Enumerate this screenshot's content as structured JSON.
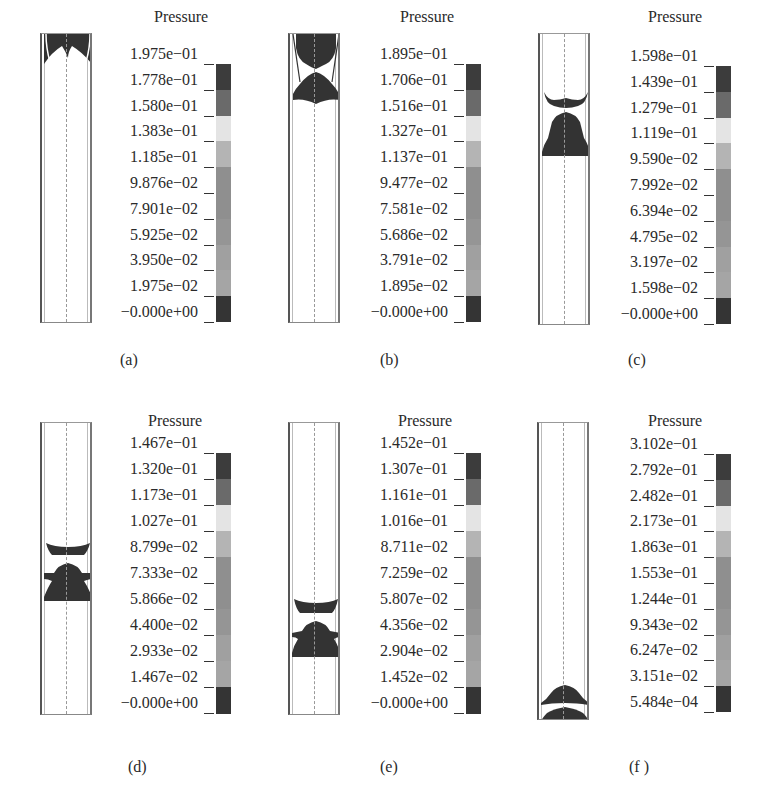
{
  "figure": {
    "colorbar_colors": [
      "#3c3c3c",
      "#6a6a6a",
      "#e4e4e4",
      "#b4b4b4",
      "#8f8f8f",
      "#8f8f8f",
      "#959595",
      "#a0a0a0",
      "#a5a5a5",
      "#343434",
      "#2c2c2c"
    ],
    "field_color": "#333333",
    "panels": [
      {
        "caption": "(a)",
        "title": "Pressure",
        "labels": [
          "1.975e−01",
          "1.778e−01",
          "1.580e−01",
          "1.383e−01",
          "1.185e−01",
          "9.876e−02",
          "7.901e−02",
          "5.925e−02",
          "3.950e−02",
          "1.975e−02",
          "−0.000e+00"
        ]
      },
      {
        "caption": "(b)",
        "title": "Pressure",
        "labels": [
          "1.895e−01",
          "1.706e−01",
          "1.516e−01",
          "1.327e−01",
          "1.137e−01",
          "9.477e−02",
          "7.581e−02",
          "5.686e−02",
          "3.791e−02",
          "1.895e−02",
          "−0.000e+00"
        ]
      },
      {
        "caption": "(c)",
        "title": "Pressure",
        "labels": [
          "1.598e−01",
          "1.439e−01",
          "1.279e−01",
          "1.119e−01",
          "9.590e−02",
          "7.992e−02",
          "6.394e−02",
          "4.795e−02",
          "3.197e−02",
          "1.598e−02",
          "−0.000e+00"
        ]
      },
      {
        "caption": "(d)",
        "title": "Pressure",
        "labels": [
          "1.467e−01",
          "1.320e−01",
          "1.173e−01",
          "1.027e−01",
          "8.799e−02",
          "7.333e−02",
          "5.866e−02",
          "4.400e−02",
          "2.933e−02",
          "1.467e−02",
          "−0.000e+00"
        ]
      },
      {
        "caption": "(e)",
        "title": "Pressure",
        "labels": [
          "1.452e−01",
          "1.307e−01",
          "1.161e−01",
          "1.016e−01",
          "8.711e−02",
          "7.259e−02",
          "5.807e−02",
          "4.356e−02",
          "2.904e−02",
          "1.452e−02",
          "−0.000e+00"
        ]
      },
      {
        "caption": "(f )",
        "title": "Pressure",
        "labels": [
          "3.102e−01",
          "2.792e−01",
          "2.482e−01",
          "2.173e−01",
          "1.863e−01",
          "1.553e−01",
          "1.244e−01",
          "9.343e−02",
          "6.247e−02",
          "3.151e−02",
          "5.484e−04"
        ]
      }
    ]
  }
}
